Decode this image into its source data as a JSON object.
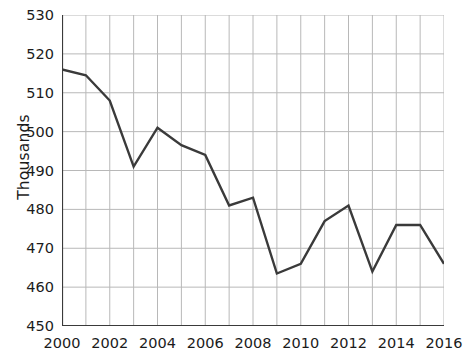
{
  "chart_data": {
    "type": "line",
    "title": "",
    "xlabel": "",
    "ylabel": "Thousands",
    "x": [
      2000,
      2001,
      2002,
      2003,
      2004,
      2005,
      2006,
      2007,
      2008,
      2009,
      2010,
      2011,
      2012,
      2013,
      2014,
      2015,
      2016
    ],
    "values": [
      516,
      514.5,
      508,
      491,
      501,
      496.5,
      494,
      481,
      483,
      463.5,
      466,
      477,
      481,
      464,
      476,
      476,
      466
    ],
    "series": [
      {
        "name": "Thousands",
        "values": [
          516,
          514.5,
          508,
          491,
          501,
          496.5,
          494,
          481,
          483,
          463.5,
          466,
          477,
          481,
          464,
          476,
          476,
          466
        ]
      }
    ],
    "xlim": [
      2000,
      2016
    ],
    "ylim": [
      450,
      530
    ],
    "y_ticks": [
      450,
      460,
      470,
      480,
      490,
      500,
      510,
      520,
      530
    ],
    "y_tick_labels": [
      "450",
      "460",
      "470",
      "480",
      "490",
      "500",
      "510",
      "520",
      "530"
    ],
    "x_ticks": [
      2000,
      2001,
      2002,
      2003,
      2004,
      2005,
      2006,
      2007,
      2008,
      2009,
      2010,
      2011,
      2012,
      2013,
      2014,
      2015,
      2016
    ],
    "x_tick_labels_shown": [
      "2000",
      "2002",
      "2004",
      "2006",
      "2008",
      "2010",
      "2012",
      "2014",
      "2016"
    ],
    "x_label_step": 2,
    "grid": true,
    "legend": false,
    "legend_position": "none",
    "line_color": "#3a3a3a",
    "grid_color": "#b8b8b8",
    "axis_color": "#3a3a3a",
    "background_color": "#ffffff",
    "markers": false
  }
}
